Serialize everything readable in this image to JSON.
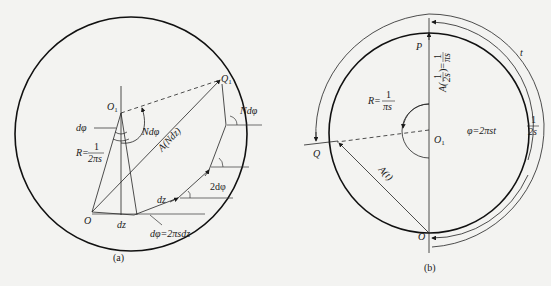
{
  "figure_a": {
    "caption": "(a)",
    "labels": {
      "Q1": "Q",
      "Q1_sub": "1",
      "O1": "O",
      "O1_sub": "1",
      "O": "O",
      "dphi_left": "dφ",
      "Ndphi_center": "Ndφ",
      "Ndphi_right": "Ndφ",
      "R_prefix": "R=",
      "R_num": "1",
      "R_den": "2πs",
      "A_Ndz": "A(Ndz)",
      "two_dphi": "2dφ",
      "dz_arc": "dz",
      "dz_bottom": "dz",
      "dphi_eq": "dφ=2πsdz"
    }
  },
  "figure_b": {
    "caption": "(b)",
    "labels": {
      "P": "P",
      "A_half": "A(",
      "A_half_num": "1",
      "A_half_den": "2s",
      "A_half_eq": ")=",
      "A_half_val_num": "1",
      "A_half_val_den": "πs",
      "R_prefix": "R=",
      "R_num": "1",
      "R_den": "πs",
      "phi_eq": "φ=2πst",
      "O1": "O",
      "O1_sub": "1",
      "Q": "Q",
      "A_t": "A(t)",
      "t": "t",
      "half_s_num": "1",
      "half_s_den": "2s",
      "O": "O"
    }
  }
}
